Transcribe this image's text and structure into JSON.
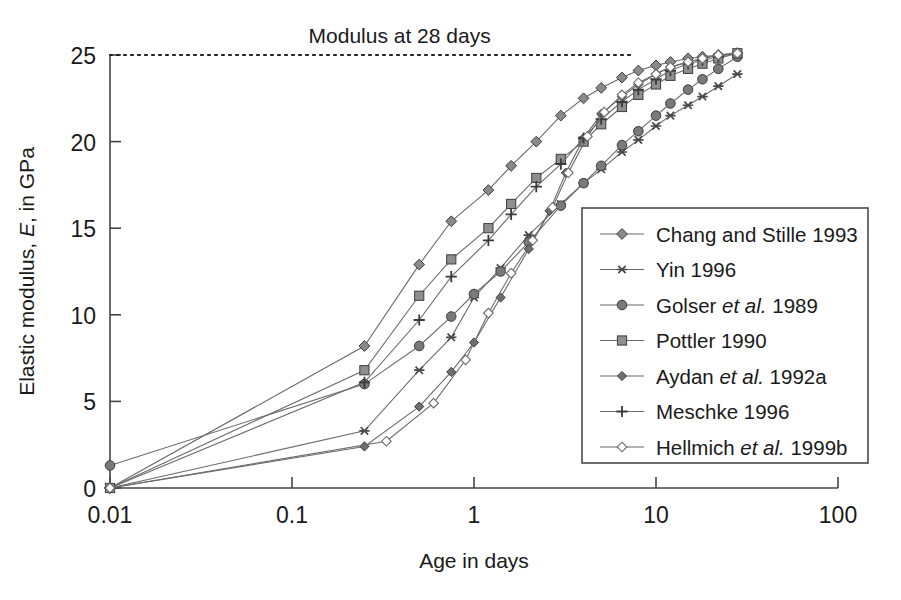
{
  "chart_data": {
    "type": "line",
    "title": "",
    "xlabel": "Age in days",
    "ylabel": "Elastic modulus, E, in GPa",
    "xscale": "log",
    "xlim": [
      0.01,
      100
    ],
    "ylim": [
      0,
      25
    ],
    "xticks": [
      "0.01",
      "0.1",
      "1",
      "10",
      "100"
    ],
    "xtick_values": [
      0.01,
      0.1,
      1,
      10,
      100
    ],
    "yticks": [
      "0",
      "5",
      "10",
      "15",
      "20",
      "25"
    ],
    "ytick_values": [
      0,
      5,
      10,
      15,
      20,
      25
    ],
    "grid": false,
    "legend_position": "inside-lower-right",
    "annotations": [
      {
        "text": "Modulus at 28 days",
        "kind": "reference-line-label",
        "y_value": 25,
        "line_style": "dotted",
        "line_x_start": 0.01,
        "line_x_end": 7.5
      }
    ],
    "series": [
      {
        "name": "Chang and Stille 1993",
        "marker": "diamond-filled",
        "color": "#8a8a8a",
        "points": [
          [
            0.01,
            0.0
          ],
          [
            0.25,
            8.2
          ],
          [
            0.5,
            12.9
          ],
          [
            0.75,
            15.4
          ],
          [
            1.2,
            17.2
          ],
          [
            1.6,
            18.6
          ],
          [
            2.2,
            20.0
          ],
          [
            3.0,
            21.5
          ],
          [
            4.0,
            22.5
          ],
          [
            5.0,
            23.1
          ],
          [
            6.5,
            23.7
          ],
          [
            8.0,
            24.1
          ],
          [
            10.0,
            24.4
          ],
          [
            12.0,
            24.6
          ],
          [
            15.0,
            24.8
          ],
          [
            18.0,
            24.9
          ],
          [
            22.0,
            25.0
          ],
          [
            28.0,
            25.1
          ]
        ]
      },
      {
        "name": "Yin 1996",
        "marker": "asterisk",
        "color": "#4a4a4a",
        "points": [
          [
            0.01,
            0.0
          ],
          [
            0.25,
            3.3
          ],
          [
            0.5,
            6.8
          ],
          [
            0.75,
            8.7
          ],
          [
            1.0,
            11.0
          ],
          [
            1.4,
            12.7
          ],
          [
            2.0,
            14.6
          ],
          [
            3.0,
            16.4
          ],
          [
            4.0,
            17.6
          ],
          [
            5.0,
            18.4
          ],
          [
            6.5,
            19.4
          ],
          [
            8.0,
            20.1
          ],
          [
            10.0,
            20.9
          ],
          [
            12.0,
            21.5
          ],
          [
            15.0,
            22.1
          ],
          [
            18.0,
            22.6
          ],
          [
            22.0,
            23.2
          ],
          [
            28.0,
            23.9
          ]
        ]
      },
      {
        "name": "Golser et al. 1989",
        "marker": "circle-filled",
        "color": "#7a7a7a",
        "points": [
          [
            0.01,
            1.3
          ],
          [
            0.25,
            6.0
          ],
          [
            0.5,
            8.2
          ],
          [
            0.75,
            9.9
          ],
          [
            1.0,
            11.2
          ],
          [
            1.4,
            12.5
          ],
          [
            2.0,
            14.2
          ],
          [
            3.0,
            16.3
          ],
          [
            4.0,
            17.6
          ],
          [
            5.0,
            18.6
          ],
          [
            6.5,
            19.8
          ],
          [
            8.0,
            20.6
          ],
          [
            10.0,
            21.5
          ],
          [
            12.0,
            22.2
          ],
          [
            15.0,
            23.0
          ],
          [
            18.0,
            23.6
          ],
          [
            22.0,
            24.2
          ],
          [
            28.0,
            24.9
          ]
        ]
      },
      {
        "name": "Pottler 1990",
        "marker": "square-filled",
        "color": "#8f8f8f",
        "points": [
          [
            0.01,
            0.0
          ],
          [
            0.25,
            6.8
          ],
          [
            0.5,
            11.1
          ],
          [
            0.75,
            13.2
          ],
          [
            1.2,
            15.0
          ],
          [
            1.6,
            16.4
          ],
          [
            2.2,
            17.9
          ],
          [
            3.0,
            19.0
          ],
          [
            4.0,
            20.0
          ],
          [
            5.0,
            21.0
          ],
          [
            6.5,
            22.0
          ],
          [
            8.0,
            22.7
          ],
          [
            10.0,
            23.3
          ],
          [
            12.0,
            23.8
          ],
          [
            15.0,
            24.2
          ],
          [
            18.0,
            24.5
          ],
          [
            22.0,
            24.8
          ],
          [
            28.0,
            25.1
          ]
        ]
      },
      {
        "name": "Aydan et al. 1992a",
        "marker": "diamond-small-filled",
        "color": "#6e6e6e",
        "points": [
          [
            0.01,
            0.0
          ],
          [
            0.25,
            2.4
          ],
          [
            0.5,
            4.7
          ],
          [
            0.75,
            6.7
          ],
          [
            1.0,
            8.4
          ],
          [
            1.4,
            11.0
          ],
          [
            2.0,
            13.8
          ],
          [
            2.6,
            16.0
          ],
          [
            3.2,
            18.2
          ],
          [
            4.0,
            20.2
          ],
          [
            5.0,
            21.6
          ],
          [
            6.5,
            22.6
          ],
          [
            8.0,
            23.3
          ],
          [
            10.0,
            23.9
          ],
          [
            12.0,
            24.3
          ],
          [
            15.0,
            24.6
          ],
          [
            18.0,
            24.8
          ],
          [
            22.0,
            25.0
          ],
          [
            28.0,
            25.1
          ]
        ]
      },
      {
        "name": "Meschke 1996",
        "marker": "plus",
        "color": "#3a3a3a",
        "points": [
          [
            0.01,
            0.0
          ],
          [
            0.25,
            6.1
          ],
          [
            0.5,
            9.7
          ],
          [
            0.75,
            12.2
          ],
          [
            1.2,
            14.3
          ],
          [
            1.6,
            15.8
          ],
          [
            2.2,
            17.4
          ],
          [
            3.0,
            18.7
          ],
          [
            4.0,
            20.2
          ],
          [
            5.0,
            21.3
          ],
          [
            6.5,
            22.3
          ],
          [
            8.0,
            23.0
          ],
          [
            10.0,
            23.6
          ],
          [
            12.0,
            24.1
          ],
          [
            15.0,
            24.5
          ],
          [
            18.0,
            24.7
          ],
          [
            22.0,
            24.9
          ],
          [
            28.0,
            25.1
          ]
        ]
      },
      {
        "name": "Hellmich et al. 1999b",
        "marker": "diamond-open",
        "color": "#9a9a9a",
        "points": [
          [
            0.01,
            0.0
          ],
          [
            0.33,
            2.7
          ],
          [
            0.6,
            4.9
          ],
          [
            0.9,
            7.4
          ],
          [
            1.2,
            10.1
          ],
          [
            1.6,
            12.4
          ],
          [
            2.1,
            14.3
          ],
          [
            2.7,
            16.2
          ],
          [
            3.3,
            18.2
          ],
          [
            4.2,
            20.3
          ],
          [
            5.2,
            21.7
          ],
          [
            6.5,
            22.7
          ],
          [
            8.0,
            23.4
          ],
          [
            10.0,
            23.9
          ],
          [
            12.0,
            24.3
          ],
          [
            15.0,
            24.6
          ],
          [
            18.0,
            24.8
          ],
          [
            22.0,
            25.0
          ],
          [
            28.0,
            25.1
          ]
        ]
      }
    ]
  },
  "legend": {
    "items": [
      {
        "label": "Chang and Stille 1993",
        "plain": "Chang and Stille 1993"
      },
      {
        "label": "Yin 1996",
        "plain": "Yin 1996"
      },
      {
        "label": "Golser et al. 1989",
        "pre": "Golser ",
        "ital": "et al.",
        "post": " 1989"
      },
      {
        "label": "Pottler 1990",
        "plain": "Pottler 1990"
      },
      {
        "label": "Aydan et al. 1992a",
        "pre": "Aydan ",
        "ital": "et al.",
        "post": " 1992a"
      },
      {
        "label": "Meschke 1996",
        "plain": "Meschke 1996"
      },
      {
        "label": "Hellmich et al. 1999b",
        "pre": "Hellmich ",
        "ital": "et al.",
        "post": " 1999b"
      }
    ]
  },
  "axis": {
    "ylabel_pre": "Elastic modulus, ",
    "ylabel_ital": "E",
    "ylabel_post": ", in GPa",
    "xlabel": "Age in days",
    "xtick_0": "0.01",
    "xtick_1": "0.1",
    "xtick_2": "1",
    "xtick_3": "10",
    "xtick_4": "100",
    "ytick_0": "0",
    "ytick_1": "5",
    "ytick_2": "10",
    "ytick_3": "15",
    "ytick_4": "20",
    "ytick_5": "25"
  },
  "annotation": {
    "modulus_label": "Modulus at 28 days"
  }
}
